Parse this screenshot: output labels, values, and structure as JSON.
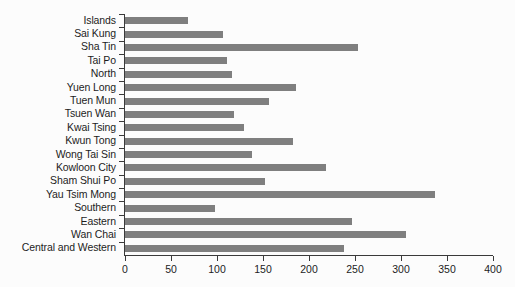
{
  "chart_data": {
    "type": "bar",
    "orientation": "horizontal",
    "title": "",
    "subtitle": "",
    "xlabel": "",
    "ylabel": "",
    "xlim": [
      0,
      400
    ],
    "xticks": [
      0,
      50,
      100,
      150,
      200,
      250,
      300,
      350,
      400
    ],
    "xtick_labels": [
      "0",
      "50",
      "100",
      "150",
      "200",
      "250",
      "300",
      "350",
      "400"
    ],
    "grid": false,
    "legend": null,
    "bar_color": "#7f7f7f",
    "axis_color": "#3a3a3a",
    "background_color": "#fcfcfc",
    "categories": [
      "Islands",
      "Sai Kung",
      "Sha Tin",
      "Tai Po",
      "North",
      "Yuen Long",
      "Tuen Mun",
      "Tsuen Wan",
      "Kwai Tsing",
      "Kwun Tong",
      "Wong Tai Sin",
      "Kowloon City",
      "Sham Shui Po",
      "Yau Tsim Mong",
      "Southern",
      "Eastern",
      "Wan Chai",
      "Central and Western"
    ],
    "values": [
      68,
      107,
      253,
      111,
      116,
      186,
      156,
      118,
      129,
      183,
      138,
      219,
      152,
      337,
      98,
      247,
      305,
      238
    ]
  }
}
